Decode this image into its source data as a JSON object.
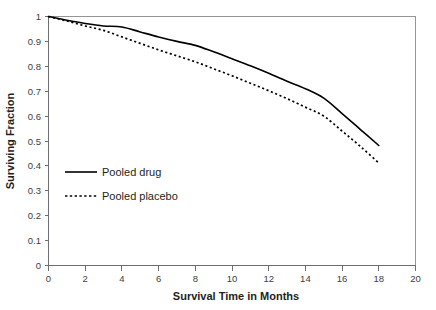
{
  "chart_data": {
    "type": "line",
    "title": "",
    "xlabel": "Survival Time in Months",
    "ylabel": "Surviving Fraction",
    "xlim": [
      0,
      20
    ],
    "ylim": [
      0,
      1
    ],
    "grid": false,
    "legend_position": "inside-left-middle",
    "xticks": [
      "0",
      "2",
      "4",
      "6",
      "8",
      "10",
      "12",
      "14",
      "16",
      "18",
      "20"
    ],
    "xtick_values": [
      0,
      2,
      4,
      6,
      8,
      10,
      12,
      14,
      16,
      18,
      20
    ],
    "yticks": [
      "0",
      "0.1",
      "0.2",
      "0.3",
      "0.4",
      "0.5",
      "0.6",
      "0.7",
      "0.8",
      "0.9",
      "1"
    ],
    "ytick_values": [
      0,
      0.1,
      0.2,
      0.3,
      0.4,
      0.5,
      0.6,
      0.7,
      0.8,
      0.9,
      1
    ],
    "x": [
      0,
      1,
      2,
      3,
      4,
      5,
      6,
      7,
      8,
      9,
      10,
      11,
      12,
      13,
      14,
      15,
      16,
      17,
      18
    ],
    "series": [
      {
        "name": "Pooled drug",
        "style": "solid",
        "color": "#000000",
        "values": [
          1.0,
          0.985,
          0.972,
          0.962,
          0.958,
          0.938,
          0.918,
          0.9,
          0.884,
          0.858,
          0.83,
          0.802,
          0.772,
          0.74,
          0.71,
          0.672,
          0.61,
          0.546,
          0.482
        ]
      },
      {
        "name": "Pooled placebo",
        "style": "dashed",
        "color": "#000000",
        "values": [
          1.0,
          0.982,
          0.962,
          0.944,
          0.918,
          0.892,
          0.866,
          0.842,
          0.818,
          0.79,
          0.762,
          0.732,
          0.702,
          0.67,
          0.636,
          0.6,
          0.54,
          0.478,
          0.412
        ]
      }
    ]
  },
  "legend": {
    "entries": [
      {
        "label": "Pooled drug",
        "style": "solid"
      },
      {
        "label": "Pooled placebo",
        "style": "dashed"
      }
    ]
  },
  "axes": {
    "x_title": "Survival Time in Months",
    "y_title": "Surviving Fraction"
  }
}
